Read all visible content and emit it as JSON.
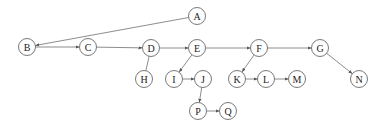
{
  "diagram": {
    "type": "directed-graph",
    "nodes": [
      {
        "id": "A",
        "label": "A"
      },
      {
        "id": "B",
        "label": "B"
      },
      {
        "id": "C",
        "label": "C"
      },
      {
        "id": "D",
        "label": "D"
      },
      {
        "id": "E",
        "label": "E"
      },
      {
        "id": "F",
        "label": "F"
      },
      {
        "id": "G",
        "label": "G"
      },
      {
        "id": "H",
        "label": "H"
      },
      {
        "id": "I",
        "label": "I"
      },
      {
        "id": "J",
        "label": "J"
      },
      {
        "id": "K",
        "label": "K"
      },
      {
        "id": "L",
        "label": "L"
      },
      {
        "id": "M",
        "label": "M"
      },
      {
        "id": "N",
        "label": "N"
      },
      {
        "id": "P",
        "label": "P"
      },
      {
        "id": "Q",
        "label": "Q"
      }
    ],
    "edges": [
      {
        "from": "A",
        "to": "B",
        "arrow": true
      },
      {
        "from": "B",
        "to": "C",
        "arrow": true
      },
      {
        "from": "C",
        "to": "D",
        "arrow": true
      },
      {
        "from": "D",
        "to": "E",
        "arrow": true
      },
      {
        "from": "E",
        "to": "F",
        "arrow": true
      },
      {
        "from": "F",
        "to": "G",
        "arrow": true
      },
      {
        "from": "D",
        "to": "H",
        "arrow": false
      },
      {
        "from": "E",
        "to": "I",
        "arrow": true
      },
      {
        "from": "I",
        "to": "J",
        "arrow": true
      },
      {
        "from": "J",
        "to": "P",
        "arrow": true
      },
      {
        "from": "P",
        "to": "Q",
        "arrow": true
      },
      {
        "from": "F",
        "to": "K",
        "arrow": true
      },
      {
        "from": "K",
        "to": "L",
        "arrow": true
      },
      {
        "from": "L",
        "to": "M",
        "arrow": true
      },
      {
        "from": "G",
        "to": "N",
        "arrow": true
      }
    ]
  }
}
